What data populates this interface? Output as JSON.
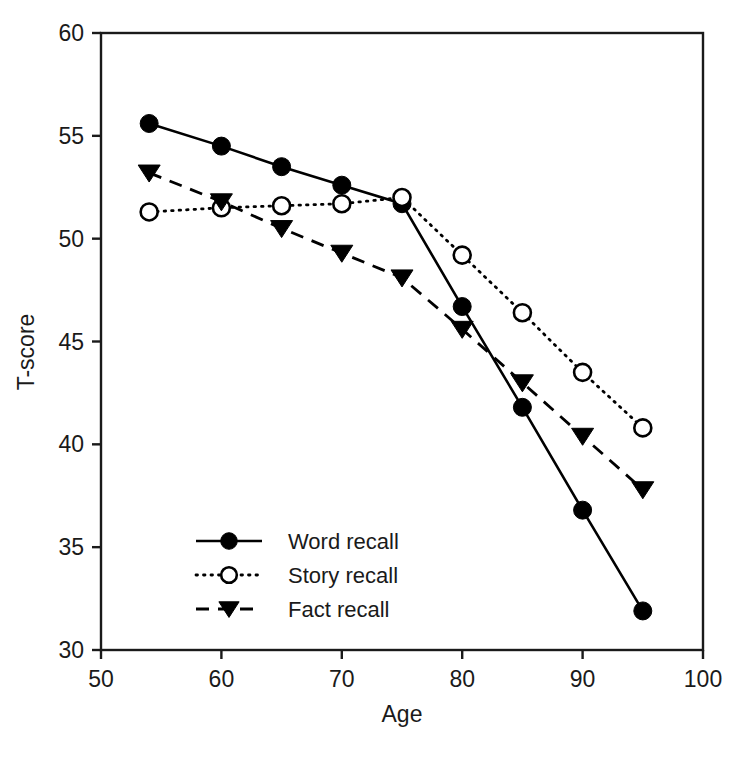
{
  "chart_data": {
    "type": "line",
    "title": "",
    "xlabel": "Age",
    "ylabel": "T-score",
    "x": [
      54,
      60,
      65,
      70,
      75,
      80,
      85,
      90,
      95
    ],
    "xlim": [
      50,
      100
    ],
    "ylim": [
      30,
      60
    ],
    "xticks": [
      50,
      60,
      70,
      80,
      90,
      100
    ],
    "yticks": [
      30,
      35,
      40,
      45,
      50,
      55,
      60
    ],
    "xtick_labels": [
      "50",
      "60",
      "70",
      "80",
      "90",
      "100"
    ],
    "ytick_labels": [
      "30",
      "35",
      "40",
      "45",
      "50",
      "55",
      "60"
    ],
    "grid": false,
    "legend_position": "lower-left-inside",
    "series": [
      {
        "name": "Word recall",
        "marker": "filled-circle",
        "line_style": "solid",
        "color": "#000000",
        "values": [
          55.6,
          54.5,
          53.5,
          52.6,
          51.7,
          46.7,
          41.8,
          36.8,
          31.9
        ]
      },
      {
        "name": "Story recall",
        "marker": "open-circle",
        "line_style": "dotted",
        "color": "#000000",
        "values": [
          51.3,
          51.5,
          51.6,
          51.7,
          52.0,
          49.2,
          46.4,
          43.5,
          40.8
        ]
      },
      {
        "name": "Fact recall",
        "marker": "triangle-down",
        "line_style": "dashed",
        "color": "#000000",
        "values": [
          53.2,
          51.8,
          50.5,
          49.3,
          48.1,
          45.6,
          43.0,
          40.4,
          37.8
        ]
      }
    ]
  },
  "legend": {
    "entries": [
      {
        "label": "Word recall"
      },
      {
        "label": "Story recall"
      },
      {
        "label": "Fact recall"
      }
    ]
  },
  "axes": {
    "x_title": "Age",
    "y_title": "T-score"
  }
}
